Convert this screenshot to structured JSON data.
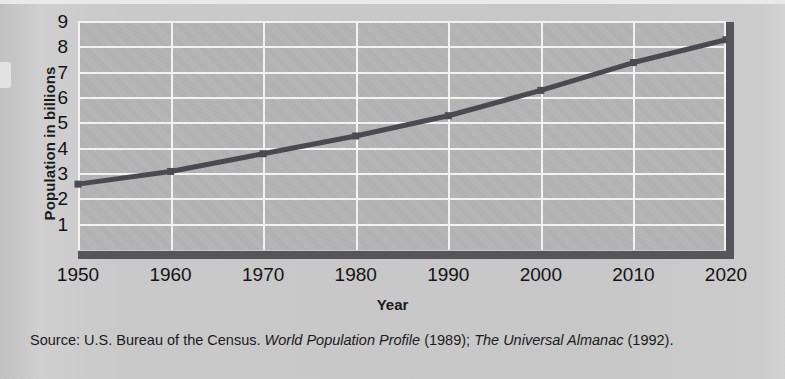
{
  "figure": {
    "y_axis_title": "Population in billions",
    "x_axis_title": "Year",
    "source_prefix": "Source: U.S. Bureau of the Census.",
    "source_title_1": "World Population  Profile",
    "source_year_1": "(1989);",
    "source_title_2": "The Universal Almanac",
    "source_year_2": "(1992)."
  },
  "colors": {
    "plot_background": "#b4b4b4",
    "gridline": "#f2f2f2",
    "axis": "#55555a",
    "series_line": "#4a4a50",
    "page_background": "#c9c9c9",
    "text": "#141414"
  },
  "chart_data": {
    "type": "line",
    "title": "",
    "xlabel": "Year",
    "ylabel": "Population in billions",
    "x": [
      1950,
      1960,
      1970,
      1980,
      1990,
      2000,
      2010,
      2020
    ],
    "categories": [
      "1950",
      "1960",
      "1970",
      "1980",
      "1990",
      "2000",
      "2010",
      "2020"
    ],
    "values": [
      2.6,
      3.1,
      3.8,
      4.5,
      5.3,
      6.3,
      7.4,
      8.3
    ],
    "series": [
      {
        "name": "World population",
        "values": [
          2.6,
          3.1,
          3.8,
          4.5,
          5.3,
          6.3,
          7.4,
          8.3
        ]
      }
    ],
    "xlim": [
      1950,
      2020
    ],
    "ylim": [
      0,
      9
    ],
    "yticks": [
      1,
      2,
      3,
      4,
      5,
      6,
      7,
      8,
      9
    ],
    "ytick_labels": [
      "1",
      "2",
      "3",
      "4",
      "5",
      "6",
      "7",
      "8",
      "9"
    ],
    "grid": true,
    "legend": "none",
    "markers": true
  }
}
